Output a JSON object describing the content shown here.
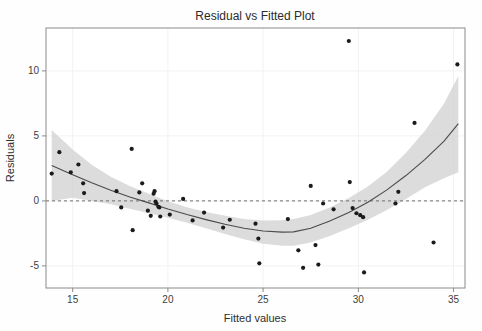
{
  "chart_data": {
    "type": "scatter",
    "title": "Residual vs Fitted Plot",
    "xlabel": "Fitted values",
    "ylabel": "Residuals",
    "xlim": [
      13.6,
      35.6
    ],
    "ylim": [
      -6.7,
      13.3
    ],
    "xticks": [
      15,
      20,
      25,
      30,
      35
    ],
    "xtick_labels": [
      "15",
      "20",
      "25",
      "30",
      "35"
    ],
    "yticks": [
      -5,
      0,
      5,
      10
    ],
    "ytick_labels": [
      "-5",
      "0",
      "5",
      "10"
    ],
    "grid": true,
    "legend": null,
    "reference_lines": [
      {
        "name": "zero-residual-line",
        "orientation": "horizontal",
        "y": 0,
        "style": "dashed"
      }
    ],
    "points": [
      [
        13.9,
        2.1
      ],
      [
        14.3,
        3.75
      ],
      [
        14.9,
        2.2
      ],
      [
        15.3,
        2.8
      ],
      [
        15.55,
        1.35
      ],
      [
        15.6,
        0.6
      ],
      [
        17.3,
        0.75
      ],
      [
        17.55,
        -0.5
      ],
      [
        18.1,
        4.0
      ],
      [
        18.15,
        -2.25
      ],
      [
        18.5,
        0.65
      ],
      [
        18.65,
        1.35
      ],
      [
        18.95,
        -0.75
      ],
      [
        19.1,
        -1.15
      ],
      [
        19.25,
        0.55
      ],
      [
        19.3,
        0.75
      ],
      [
        19.35,
        -0.05
      ],
      [
        19.4,
        -0.2
      ],
      [
        19.5,
        -0.45
      ],
      [
        19.55,
        -0.5
      ],
      [
        19.6,
        -1.2
      ],
      [
        20.1,
        -1.05
      ],
      [
        20.8,
        0.15
      ],
      [
        21.3,
        -1.5
      ],
      [
        21.9,
        -0.9
      ],
      [
        22.9,
        -2.05
      ],
      [
        23.25,
        -1.45
      ],
      [
        24.6,
        -1.75
      ],
      [
        24.75,
        -2.9
      ],
      [
        24.8,
        -4.8
      ],
      [
        26.3,
        -1.4
      ],
      [
        26.85,
        -3.8
      ],
      [
        27.1,
        -5.15
      ],
      [
        27.5,
        1.15
      ],
      [
        27.75,
        -3.4
      ],
      [
        27.9,
        -4.9
      ],
      [
        28.15,
        -0.2
      ],
      [
        28.7,
        -0.65
      ],
      [
        29.5,
        12.3
      ],
      [
        29.55,
        1.45
      ],
      [
        29.7,
        -0.55
      ],
      [
        29.9,
        -0.95
      ],
      [
        30.1,
        -1.1
      ],
      [
        30.25,
        -1.25
      ],
      [
        30.3,
        -5.5
      ],
      [
        31.95,
        -0.2
      ],
      [
        32.1,
        0.7
      ],
      [
        32.95,
        6.0
      ],
      [
        33.95,
        -3.2
      ],
      [
        35.2,
        10.5
      ]
    ],
    "fit_line": [
      [
        13.9,
        2.72
      ],
      [
        15.0,
        2.02
      ],
      [
        16.0,
        1.4
      ],
      [
        17.0,
        0.82
      ],
      [
        18.0,
        0.3
      ],
      [
        19.0,
        -0.15
      ],
      [
        20.0,
        -0.62
      ],
      [
        21.0,
        -1.05
      ],
      [
        22.0,
        -1.44
      ],
      [
        23.0,
        -1.8
      ],
      [
        24.0,
        -2.1
      ],
      [
        25.0,
        -2.32
      ],
      [
        26.0,
        -2.4
      ],
      [
        26.6,
        -2.38
      ],
      [
        27.5,
        -2.1
      ],
      [
        28.5,
        -1.55
      ],
      [
        29.5,
        -0.9
      ],
      [
        30.5,
        -0.1
      ],
      [
        31.5,
        0.85
      ],
      [
        32.5,
        1.95
      ],
      [
        33.5,
        3.2
      ],
      [
        34.5,
        4.6
      ],
      [
        35.25,
        5.95
      ]
    ],
    "ci_upper": [
      [
        13.9,
        5.45
      ],
      [
        15.0,
        3.95
      ],
      [
        16.0,
        2.78
      ],
      [
        17.0,
        1.85
      ],
      [
        18.0,
        1.15
      ],
      [
        19.0,
        0.55
      ],
      [
        20.0,
        -0.02
      ],
      [
        21.0,
        -0.48
      ],
      [
        22.0,
        -0.85
      ],
      [
        23.0,
        -1.15
      ],
      [
        24.0,
        -1.4
      ],
      [
        25.0,
        -1.5
      ],
      [
        26.0,
        -1.48
      ],
      [
        26.6,
        -1.4
      ],
      [
        27.5,
        -1.08
      ],
      [
        28.5,
        -0.5
      ],
      [
        29.5,
        0.22
      ],
      [
        30.5,
        1.1
      ],
      [
        31.5,
        2.25
      ],
      [
        32.5,
        3.7
      ],
      [
        33.5,
        5.4
      ],
      [
        34.5,
        7.5
      ],
      [
        35.25,
        9.6
      ]
    ],
    "ci_lower": [
      [
        13.9,
        0.0
      ],
      [
        15.0,
        0.25
      ],
      [
        16.0,
        0.0
      ],
      [
        17.0,
        -0.25
      ],
      [
        18.0,
        -0.6
      ],
      [
        19.0,
        -0.95
      ],
      [
        20.0,
        -1.3
      ],
      [
        21.0,
        -1.68
      ],
      [
        22.0,
        -2.1
      ],
      [
        23.0,
        -2.55
      ],
      [
        24.0,
        -2.95
      ],
      [
        25.0,
        -3.3
      ],
      [
        26.0,
        -3.45
      ],
      [
        26.6,
        -3.45
      ],
      [
        27.5,
        -3.2
      ],
      [
        28.5,
        -2.7
      ],
      [
        29.5,
        -2.1
      ],
      [
        30.5,
        -1.45
      ],
      [
        31.5,
        -0.7
      ],
      [
        32.5,
        0.15
      ],
      [
        33.5,
        1.05
      ],
      [
        34.5,
        1.75
      ],
      [
        35.25,
        2.2
      ]
    ]
  }
}
